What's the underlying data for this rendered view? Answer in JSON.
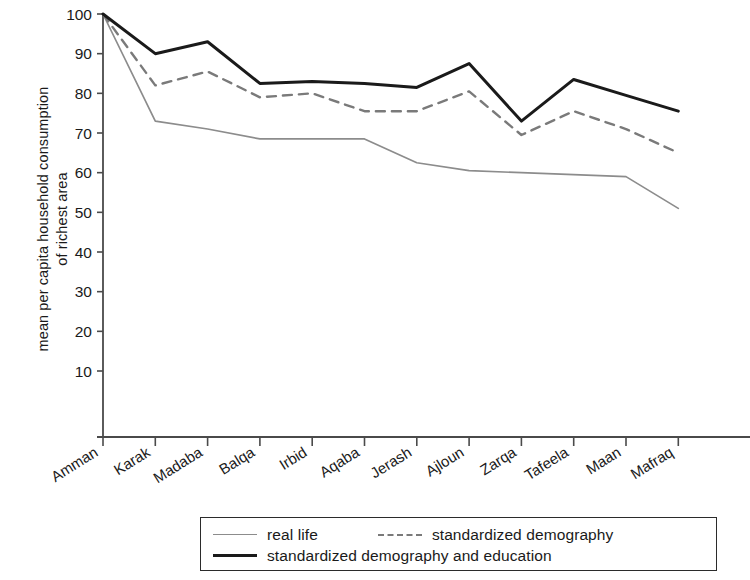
{
  "chart_data": {
    "type": "line",
    "title": "",
    "xlabel": "",
    "ylabel": "mean per capita household consumption\nof richest area",
    "ylim": [
      0,
      100
    ],
    "yticks": [
      10,
      20,
      30,
      40,
      50,
      60,
      70,
      80,
      90,
      100
    ],
    "grid": false,
    "legend_position": "bottom",
    "categories": [
      "Amman",
      "Karak",
      "Madaba",
      "Balqa",
      "Irbid",
      "Aqaba",
      "Jerash",
      "Ajloun",
      "Zarqa",
      "Tafeela",
      "Maan",
      "Mafraq"
    ],
    "series": [
      {
        "name": "real life",
        "style": "solid-thin",
        "color": "#8c8c8c",
        "values": [
          100,
          73,
          71,
          68.5,
          68.5,
          68.5,
          62.5,
          60.5,
          60,
          59.5,
          59,
          51
        ]
      },
      {
        "name": "standardized demography",
        "style": "dashed",
        "color": "#7a7a7a",
        "values": [
          100,
          82,
          85.5,
          79,
          80,
          75.5,
          75.5,
          80.5,
          69.5,
          75.5,
          71,
          65
        ]
      },
      {
        "name": "standardized demography and education",
        "style": "solid-thick",
        "color": "#1a1a1a",
        "values": [
          100,
          90,
          93,
          82.5,
          83,
          82.5,
          81.5,
          87.5,
          73,
          83.5,
          79.5,
          75.5
        ]
      }
    ]
  },
  "legend": {
    "items": [
      {
        "label": "real life"
      },
      {
        "label": "standardized demography"
      },
      {
        "label": "standardized demography and education"
      }
    ]
  },
  "axis": {
    "y_title": "mean per capita household consumption\nof richest area",
    "y_tick_labels": [
      "100",
      "90",
      "80",
      "70",
      "60",
      "50",
      "40",
      "30",
      "20",
      "10"
    ],
    "x_tick_labels": [
      "Amman",
      "Karak",
      "Madaba",
      "Balqa",
      "Irbid",
      "Aqaba",
      "Jerash",
      "Ajloun",
      "Zarqa",
      "Tafeela",
      "Maan",
      "Mafraq"
    ]
  }
}
